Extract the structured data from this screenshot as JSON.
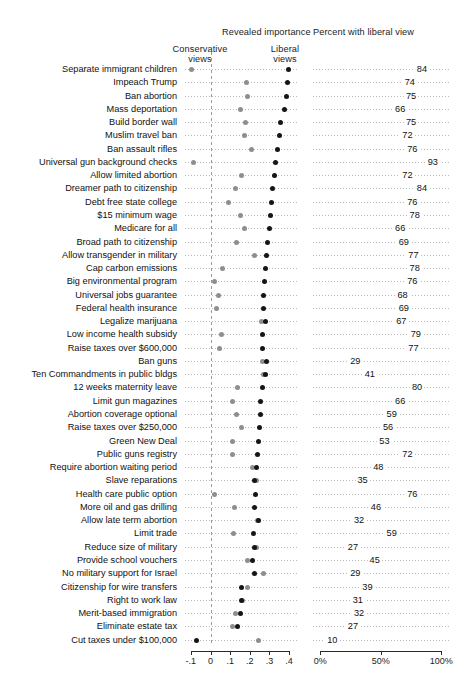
{
  "headers": {
    "left_panel": "Revealed importance",
    "right_panel": "Percent with liberal view",
    "conservative": "Conservative\nviews",
    "conservative_line1": "Conservative",
    "conservative_line2": "views",
    "liberal_line1": "Liberal",
    "liberal_line2": "views"
  },
  "colors": {
    "conservative_dot": "#8e8e8e",
    "liberal_dot": "#151515",
    "leader": "#b9b9b9",
    "zero_line": "#9a9a9a",
    "axis": "#2b2b2b",
    "text": "#111111",
    "background": "#ffffff"
  },
  "chart_data": {
    "type": "scatter",
    "title": "",
    "panels": [
      {
        "name": "revealed-importance",
        "xlabel": "Revealed importance",
        "xlim": [
          -0.13,
          0.44
        ],
        "ticks": [
          -0.1,
          0,
          0.1,
          0.2,
          0.3,
          0.4
        ],
        "ticklabels": [
          "-.1",
          "0",
          ".1",
          ".2",
          ".3",
          ".4"
        ],
        "grid": false,
        "legend": [
          "Conservative views",
          "Liberal views"
        ],
        "legend_position": "top",
        "zero_reference": 0
      },
      {
        "name": "percent-liberal-view",
        "xlabel": "Percent with liberal view",
        "xlim": [
          -6,
          108
        ],
        "ticks": [
          0,
          50,
          100
        ],
        "ticklabels": [
          "0%",
          "50%",
          "100%"
        ],
        "grid": false
      }
    ],
    "categories": [
      "Separate immigrant children",
      "Impeach Trump",
      "Ban abortion",
      "Mass deportation",
      "Build border wall",
      "Muslim travel ban",
      "Ban assault rifles",
      "Universal gun background checks",
      "Allow limited abortion",
      "Dreamer path to citizenship",
      "Debt free state college",
      "$15 minimum wage",
      "Medicare for all",
      "Broad path to citizenship",
      "Allow transgender in military",
      "Cap carbon emissions",
      "Big environmental program",
      "Universal jobs guarantee",
      "Federal health insurance",
      "Legalize marijuana",
      "Low income health subsidy",
      "Raise taxes over $600,000",
      "Ban guns",
      "Ten Commandments in public bldgs",
      "12 weeks maternity leave",
      "Limit gun magazines",
      "Abortion coverage optional",
      "Raise taxes over $250,000",
      "Green New Deal",
      "Public guns registry",
      "Require abortion waiting period",
      "Slave reparations",
      "Health care public option",
      "More oil and gas drilling",
      "Allow late term abortion",
      "Limit trade",
      "Reduce size of military",
      "Provide school vouchers",
      "No military support for Israel",
      "Citizenship for wire transfers",
      "Right to work law",
      "Merit-based immigration",
      "Eliminate estate tax",
      "Cut taxes under $100,000"
    ],
    "series": [
      {
        "name": "Conservative views",
        "color": "#8e8e8e",
        "values": [
          -0.095,
          0.185,
          0.187,
          0.152,
          0.177,
          0.175,
          0.21,
          -0.085,
          0.16,
          0.125,
          0.09,
          0.152,
          0.172,
          0.132,
          0.226,
          0.062,
          0.02,
          0.04,
          0.031,
          0.26,
          0.058,
          0.044,
          0.262,
          0.268,
          0.135,
          0.114,
          0.132,
          0.16,
          0.111,
          0.112,
          0.216,
          0.233,
          0.02,
          0.124,
          0.238,
          0.117,
          0.232,
          0.188,
          0.268,
          0.186,
          0.165,
          0.128,
          0.112,
          0.244
        ]
      },
      {
        "name": "Liberal views",
        "color": "#151515",
        "values": [
          0.395,
          0.392,
          0.386,
          0.374,
          0.355,
          0.352,
          0.341,
          0.33,
          0.325,
          0.315,
          0.31,
          0.305,
          0.298,
          0.292,
          0.283,
          0.28,
          0.276,
          0.272,
          0.268,
          0.282,
          0.266,
          0.262,
          0.283,
          0.28,
          0.262,
          0.256,
          0.252,
          0.248,
          0.244,
          0.24,
          0.234,
          0.226,
          0.228,
          0.224,
          0.246,
          0.218,
          0.222,
          0.214,
          0.224,
          0.158,
          0.156,
          0.15,
          0.138,
          -0.072
        ]
      }
    ],
    "percent_liberal_view": [
      84,
      74,
      75,
      66,
      75,
      72,
      76,
      93,
      72,
      84,
      76,
      78,
      66,
      69,
      77,
      78,
      76,
      68,
      69,
      67,
      79,
      77,
      29,
      41,
      80,
      66,
      59,
      56,
      53,
      72,
      48,
      35,
      76,
      46,
      32,
      59,
      27,
      45,
      29,
      39,
      31,
      32,
      27,
      10
    ]
  }
}
